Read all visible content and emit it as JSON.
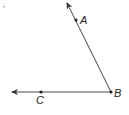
{
  "diagram": {
    "type": "angle",
    "vertex": {
      "label": "B",
      "x": 111,
      "y": 92
    },
    "points": [
      {
        "label": "A",
        "x": 76,
        "y": 20
      },
      {
        "label": "C",
        "x": 41,
        "y": 92
      }
    ],
    "rays": [
      {
        "from": "B",
        "through": "A",
        "end": {
          "x": 67,
          "y": 3
        }
      },
      {
        "from": "B",
        "through": "C",
        "end": {
          "x": 12,
          "y": 92
        }
      }
    ],
    "colors": {
      "line": "#333333",
      "point": "#222222",
      "label": "#222222"
    }
  },
  "labels": {
    "A": "A",
    "B": "B",
    "C": "C"
  }
}
